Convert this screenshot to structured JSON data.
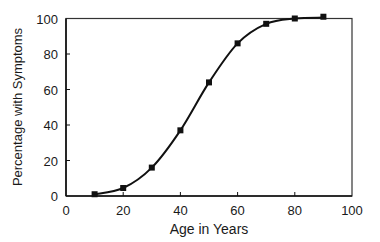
{
  "chart_data": {
    "type": "scatter",
    "title": "",
    "xlabel": "Age in Years",
    "ylabel": "Percentage with Symptoms",
    "xlim": [
      0,
      100
    ],
    "ylim": [
      0,
      100
    ],
    "grid": false,
    "legend": "none",
    "x_ticks": [
      0,
      20,
      40,
      60,
      80,
      100
    ],
    "y_ticks": [
      0,
      20,
      40,
      60,
      80,
      100
    ],
    "x_tick_labels": [
      "0",
      "20",
      "40",
      "60",
      "80",
      "100"
    ],
    "y_tick_labels": [
      "0",
      "20",
      "40",
      "60",
      "80",
      "100"
    ],
    "series": [
      {
        "name": "observed",
        "marker": "square",
        "x": [
          10,
          20,
          30,
          40,
          50,
          60,
          70,
          80,
          90
        ],
        "y": [
          1,
          4.5,
          16,
          37,
          64,
          86,
          97,
          100,
          101
        ]
      }
    ],
    "fit_curve": {
      "name": "fitted sigmoid",
      "style": "smooth line"
    },
    "colors": {
      "ink": "#111111",
      "frame": "#333333"
    }
  }
}
